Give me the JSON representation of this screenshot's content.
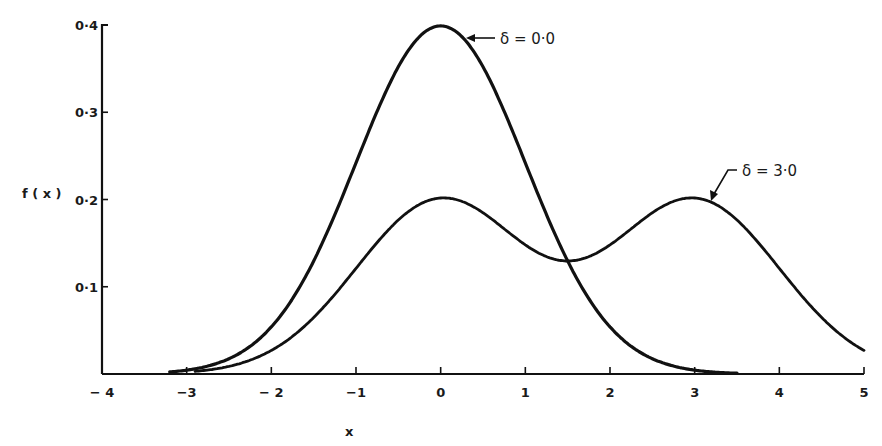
{
  "chart_data": {
    "type": "line",
    "title": "",
    "xlabel": "x",
    "ylabel": "f(x)",
    "xlim": [
      -4,
      5
    ],
    "ylim": [
      0,
      0.4
    ],
    "grid": false,
    "x_ticks": [
      "− 4",
      "−3",
      "− 2",
      "−1",
      "0",
      "1",
      "2",
      "3",
      "4",
      "5"
    ],
    "y_ticks": [
      "0·1",
      "0·2",
      "0·3",
      "0·4"
    ],
    "series": [
      {
        "name": "δ = 0·0",
        "description": "standard normal density",
        "x": [
          -3.2,
          -3,
          -2.5,
          -2,
          -1.5,
          -1,
          -0.5,
          0,
          0.5,
          1,
          1.5,
          2,
          2.5,
          3,
          3.5
        ],
        "values": [
          0.002,
          0.004,
          0.018,
          0.054,
          0.13,
          0.242,
          0.352,
          0.399,
          0.352,
          0.242,
          0.13,
          0.054,
          0.018,
          0.004,
          0.001
        ]
      },
      {
        "name": "δ = 3·0",
        "description": "mixture density with modes at 0 and 3",
        "x": [
          -3,
          -2.5,
          -2,
          -1.5,
          -1,
          -0.5,
          0,
          0.5,
          1,
          1.5,
          2,
          2.5,
          3,
          3.5,
          4,
          4.5,
          5
        ],
        "values": [
          0.002,
          0.009,
          0.027,
          0.065,
          0.121,
          0.177,
          0.2,
          0.185,
          0.148,
          0.13,
          0.148,
          0.185,
          0.2,
          0.177,
          0.121,
          0.065,
          0.027
        ]
      }
    ],
    "annotations": [
      {
        "text": "δ = 0·0",
        "points_to_x": -0.0,
        "points_to_y": 0.397
      },
      {
        "text": "δ = 3·0",
        "points_to_x": 3.3,
        "points_to_y": 0.19
      }
    ]
  },
  "labels": {
    "ylabel": "f ( x )",
    "xlabel": "x",
    "ann0": "δ = 0·0",
    "ann3": "δ = 3·0"
  }
}
